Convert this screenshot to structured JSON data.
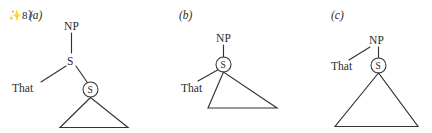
{
  "figure": {
    "example_number": "✨8〉",
    "panels": [
      {
        "id": "a",
        "letter": "(a)",
        "nodes": {
          "np": "NP",
          "s_upper": "S",
          "s_circled": "S",
          "terminal": "That"
        }
      },
      {
        "id": "b",
        "letter": "(b)",
        "nodes": {
          "np": "NP",
          "s_circled": "S",
          "terminal": "That"
        }
      },
      {
        "id": "c",
        "letter": "(c)",
        "nodes": {
          "np": "NP",
          "s_circled": "S",
          "terminal": "That"
        }
      }
    ]
  },
  "colors": {
    "background": "#ffffff",
    "ink": "#2b2b2b",
    "stroke": "#333333"
  }
}
